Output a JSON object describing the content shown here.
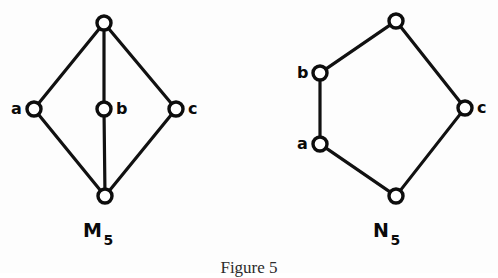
{
  "figure": {
    "caption": "Figure 5",
    "background_color": "#fdfdfd",
    "ink_color": "#111111"
  },
  "graphs": [
    {
      "id": "M5",
      "name_letter": "M",
      "name_subscript": "5",
      "name_full": "M5",
      "shape": "diamond-with-vertical-chord",
      "nodes": [
        {
          "id": "top",
          "label": "",
          "label_position": "none",
          "cx": 104,
          "cy": 23,
          "r": 7
        },
        {
          "id": "a",
          "label": "a",
          "label_position": "left",
          "cx": 34,
          "cy": 109,
          "r": 7
        },
        {
          "id": "b",
          "label": "b",
          "label_position": "right",
          "cx": 104,
          "cy": 109,
          "r": 7
        },
        {
          "id": "c",
          "label": "c",
          "label_position": "right",
          "cx": 176,
          "cy": 109,
          "r": 7
        },
        {
          "id": "bottom",
          "label": "",
          "label_position": "none",
          "cx": 105,
          "cy": 196,
          "r": 7
        }
      ],
      "edges": [
        [
          "top",
          "a"
        ],
        [
          "top",
          "c"
        ],
        [
          "top",
          "b"
        ],
        [
          "b",
          "bottom"
        ],
        [
          "a",
          "bottom"
        ],
        [
          "c",
          "bottom"
        ]
      ]
    },
    {
      "id": "N5",
      "name_letter": "N",
      "name_subscript": "5",
      "name_full": "N5",
      "shape": "pentagon-cycle",
      "nodes": [
        {
          "id": "top",
          "label": "",
          "label_position": "none",
          "cx": 396,
          "cy": 21,
          "r": 7
        },
        {
          "id": "b",
          "label": "b",
          "label_position": "left",
          "cx": 320,
          "cy": 73,
          "r": 7
        },
        {
          "id": "a",
          "label": "a",
          "label_position": "left",
          "cx": 320,
          "cy": 144,
          "r": 7
        },
        {
          "id": "bottom",
          "label": "",
          "label_position": "none",
          "cx": 396,
          "cy": 196,
          "r": 7
        },
        {
          "id": "c",
          "label": "c",
          "label_position": "right",
          "cx": 465,
          "cy": 108,
          "r": 7
        }
      ],
      "edges": [
        [
          "top",
          "b"
        ],
        [
          "b",
          "a"
        ],
        [
          "a",
          "bottom"
        ],
        [
          "bottom",
          "c"
        ],
        [
          "c",
          "top"
        ]
      ]
    }
  ]
}
